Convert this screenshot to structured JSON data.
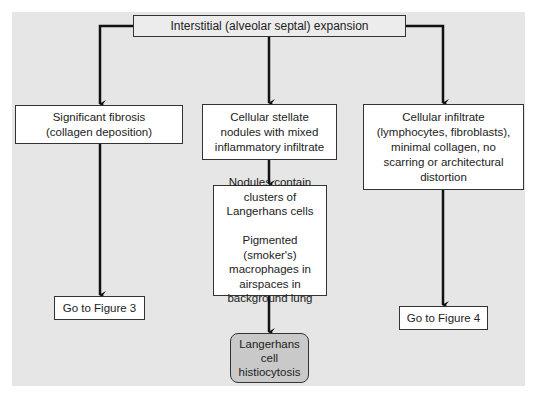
{
  "diagram": {
    "root": {
      "label": "Interstitial (alveolar septal) expansion"
    },
    "branches": [
      {
        "label": "Significant fibrosis\n(collagen deposition)",
        "next": {
          "label": "Go to Figure 3"
        }
      },
      {
        "label": "Cellular stellate\nnodules with mixed\ninflammatory infiltrate",
        "next": {
          "label": "Nodules contain\nclusters of\nLangerhans cells\n\nPigmented (smoker's)\nmacrophages in\nairspaces in\nbackground lung",
          "next": {
            "label": "Langerhans\ncell\nhistiocytosis"
          }
        }
      },
      {
        "label": "Cellular infiltrate\n(lymphocytes, fibroblasts),\nminimal collagen, no\nscarring or architectural\ndistortion",
        "next": {
          "label": "Go to Figure 4"
        }
      }
    ]
  },
  "colors": {
    "panel": "#e6e6e6",
    "box": "#ffffff",
    "root_box": "#ececec",
    "final_box": "#c9c9c9",
    "line": "#111111"
  }
}
